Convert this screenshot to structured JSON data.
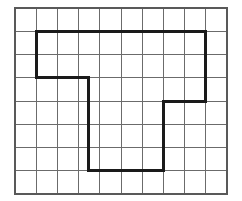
{
  "figure": {
    "canvas": {
      "width": 242,
      "height": 201,
      "background": "#ffffff"
    },
    "grid": {
      "columns": 10,
      "rows": 8,
      "origin_x": 15,
      "origin_y": 8,
      "cell_width": 21.2,
      "cell_height": 23.25,
      "line_color": "#6b6b6b",
      "line_width": 1,
      "border_color": "#595959",
      "border_width": 2
    },
    "shape": {
      "name": "zigzag-polygon",
      "stroke_color": "#1a1a1a",
      "stroke_width": 3,
      "fill": "none",
      "closed": true,
      "vertices_grid": [
        [
          1,
          1
        ],
        [
          9,
          1
        ],
        [
          9,
          4
        ],
        [
          7,
          4
        ],
        [
          7,
          7
        ],
        [
          3.45,
          7
        ],
        [
          3.45,
          3
        ],
        [
          1,
          3
        ]
      ],
      "vertices_px": [
        [
          36.2,
          31.3
        ],
        [
          205.8,
          31.3
        ],
        [
          205.8,
          101.0
        ],
        [
          163.4,
          101.0
        ],
        [
          163.4,
          170.8
        ],
        [
          88.1,
          170.8
        ],
        [
          88.1,
          77.8
        ],
        [
          36.2,
          77.8
        ]
      ]
    }
  }
}
